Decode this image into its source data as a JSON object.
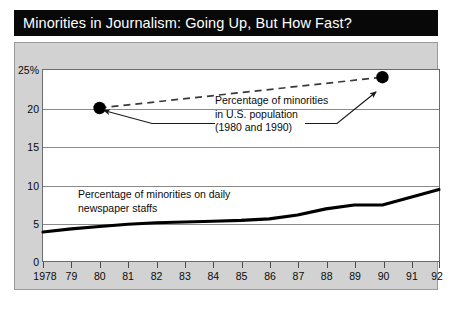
{
  "title": "Minorities in Journalism: Going Up, But How Fast?",
  "annotations": {
    "population_line1": "Percentage of minorities",
    "population_line2": "in U.S. population",
    "population_line3": "(1980 and 1990)",
    "staffs_line1": "Percentage of minorities on daily",
    "staffs_line2": "newspaper staffs"
  },
  "colors": {
    "title_bar": "#080808",
    "title_text": "#ffffff",
    "panel": "#d2d2d2",
    "plot_background": "#ffffff",
    "gridline": "#8a8a8a",
    "series_line": "#000000",
    "marker": "#000000",
    "leader": "#333333"
  },
  "chart_data": {
    "type": "line",
    "title": "Minorities in Journalism: Going Up, But How Fast?",
    "xlabel": "",
    "ylabel": "",
    "xlim": [
      1978,
      1992
    ],
    "ylim": [
      0,
      25
    ],
    "grid": true,
    "legend_position": "none",
    "y_ticks": [
      0,
      5,
      10,
      15,
      20,
      25
    ],
    "y_tick_labels": [
      "0",
      "5",
      "10",
      "15",
      "20",
      "25%"
    ],
    "x_ticks": [
      1978,
      1979,
      1980,
      1981,
      1982,
      1983,
      1984,
      1985,
      1986,
      1987,
      1988,
      1989,
      1990,
      1991,
      1992
    ],
    "x_tick_labels": [
      "1978",
      "79",
      "80",
      "81",
      "82",
      "83",
      "84",
      "85",
      "86",
      "87",
      "88",
      "89",
      "90",
      "91",
      "92"
    ],
    "series": [
      {
        "name": "Percentage of minorities on daily newspaper staffs",
        "style": "solid",
        "x": [
          1978,
          1979,
          1980,
          1981,
          1982,
          1983,
          1984,
          1985,
          1986,
          1987,
          1988,
          1989,
          1990,
          1991,
          1992
        ],
        "values": [
          3.9,
          4.3,
          4.6,
          4.9,
          5.1,
          5.2,
          5.3,
          5.4,
          5.6,
          6.1,
          6.9,
          7.4,
          7.4,
          8.4,
          9.4
        ]
      },
      {
        "name": "Percentage of minorities in U.S. population (1980 and 1990)",
        "style": "dashed",
        "x": [
          1980,
          1990
        ],
        "values": [
          20.0,
          24.0
        ],
        "markers": true
      }
    ]
  }
}
